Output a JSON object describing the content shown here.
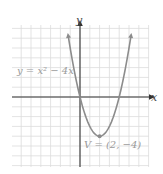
{
  "chart_data": {
    "type": "line",
    "title": "",
    "function": "y = x^2 - 4x",
    "xlabel": "x",
    "ylabel": "y",
    "xlim": [
      -7,
      7
    ],
    "ylim": [
      -7,
      7
    ],
    "grid": true,
    "grid_step": 1,
    "series": [
      {
        "name": "y = x² − 4x",
        "x": [
          -1.2,
          -1,
          0,
          1,
          2,
          3,
          4,
          5,
          5.2
        ],
        "values": [
          6.24,
          5,
          0,
          -3,
          -4,
          -3,
          0,
          5,
          6.24
        ]
      }
    ],
    "annotations": [
      {
        "text": "y = x² − 4x",
        "position": "upper-left"
      },
      {
        "text": "V = (2, −4)",
        "point": [
          2,
          -4
        ]
      }
    ],
    "colors": {
      "curve": "#8c8c8c",
      "axes": "#333333",
      "grid": "#dcdcdc",
      "label": "#9a9a9a"
    }
  },
  "labels": {
    "equation": "y = x² − 4x",
    "vertex": "V = (2, −4)",
    "x_axis": "x",
    "y_axis": "y"
  }
}
